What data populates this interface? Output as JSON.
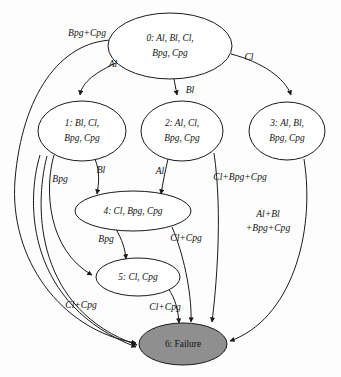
{
  "diagram": {
    "type": "state-machine",
    "background_color": "#fdfdfd",
    "node_fill": "#ffffff",
    "failure_fill": "#8f8f8f",
    "stroke_color": "#1a1a1a",
    "nodes": [
      {
        "id": "0",
        "lines": [
          "0: Al, Bl, Cl,",
          "Bpg, Cpg"
        ],
        "line1": "0: Al, Bl, Cl,",
        "line2": "Bpg, Cpg",
        "cx": 170,
        "cy": 46,
        "rx": 62,
        "ry": 33,
        "failure": false
      },
      {
        "id": "1",
        "lines": [
          "1: Bl, Cl,",
          "Bpg, Cpg"
        ],
        "line1": "1: Bl, Cl,",
        "line2": "Bpg, Cpg",
        "cx": 82,
        "cy": 131,
        "rx": 44,
        "ry": 30,
        "failure": false
      },
      {
        "id": "2",
        "lines": [
          "2: Al, Cl,",
          "Bpg, Cpg"
        ],
        "line1": "2: Al, Cl,",
        "line2": "Bpg, Cpg",
        "cx": 182,
        "cy": 131,
        "rx": 41,
        "ry": 30,
        "failure": false
      },
      {
        "id": "3",
        "lines": [
          "3: Al, Bl,",
          "Bpg, Cpg"
        ],
        "line1": "3: Al, Bl,",
        "line2": "Bpg, Cpg",
        "cx": 287,
        "cy": 131,
        "rx": 38,
        "ry": 29,
        "failure": false
      },
      {
        "id": "4",
        "lines": [
          "4: Cl, Bpg, Cpg"
        ],
        "line1": "4: Cl, Bpg, Cpg",
        "line2": "",
        "cx": 133,
        "cy": 211,
        "rx": 58,
        "ry": 20,
        "failure": false
      },
      {
        "id": "5",
        "lines": [
          "5: Cl, Cpg"
        ],
        "line1": "5: Cl, Cpg",
        "line2": "",
        "cx": 138,
        "cy": 277,
        "rx": 42,
        "ry": 19,
        "failure": false
      },
      {
        "id": "6",
        "lines": [
          "6: Failure"
        ],
        "line1": "6: Failure",
        "line2": "",
        "cx": 183,
        "cy": 344,
        "rx": 44,
        "ry": 21,
        "failure": true
      }
    ],
    "edges": [
      {
        "from": "0",
        "to": "1",
        "label": "Al",
        "lx": 113,
        "ly": 65
      },
      {
        "from": "0",
        "to": "2",
        "label": "Bl",
        "lx": 190,
        "ly": 91
      },
      {
        "from": "0",
        "to": "3",
        "label": "Cl",
        "lx": 249,
        "ly": 58
      },
      {
        "from": "0",
        "to": "6",
        "label": "Bpg+Cpg",
        "lx": 87,
        "ly": 34
      },
      {
        "from": "1",
        "to": "4",
        "label": "Bl",
        "lx": 101,
        "ly": 171
      },
      {
        "from": "1",
        "to": "5",
        "label": "Bpg",
        "lx": 60,
        "ly": 180
      },
      {
        "from": "1",
        "to": "6",
        "label": "Cl+Cpg",
        "lx": 81,
        "ly": 306
      },
      {
        "from": "2",
        "to": "4",
        "label": "Al",
        "lx": 160,
        "ly": 172
      },
      {
        "from": "2",
        "to": "6",
        "label": "Cl+Bpg+Cpg",
        "lx": 240,
        "ly": 178
      },
      {
        "from": "3",
        "to": "6",
        "label": "Al+Bl",
        "lx": 268,
        "ly": 215
      },
      {
        "from": "3",
        "to": "6",
        "label": "+Bpg+Cpg",
        "lx": 268,
        "ly": 229
      },
      {
        "from": "4",
        "to": "5",
        "label": "Bpg",
        "lx": 106,
        "ly": 240
      },
      {
        "from": "4",
        "to": "6",
        "label": "Cl+Cpg",
        "lx": 186,
        "ly": 239
      },
      {
        "from": "5",
        "to": "6",
        "label": "Cl+Cpg",
        "lx": 165,
        "ly": 308
      }
    ]
  }
}
